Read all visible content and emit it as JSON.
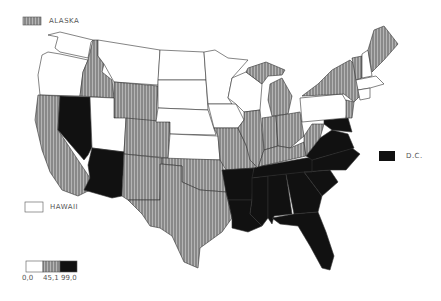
{
  "map": {
    "type": "choropleth",
    "region": "United States",
    "categories": [
      {
        "name": "low",
        "fill": "white",
        "color": "#ffffff"
      },
      {
        "name": "mid",
        "fill": "hatched",
        "color": "#8a8a8a"
      },
      {
        "name": "high",
        "fill": "black",
        "color": "#111111"
      }
    ],
    "insets": {
      "alaska": {
        "label": "ALASKA",
        "category": "mid"
      },
      "hawaii": {
        "label": "HAWAII",
        "category": "low"
      },
      "dc": {
        "label": "D.C.",
        "category": "high"
      }
    },
    "legend": {
      "values": [
        "0,0",
        "45,1",
        "99,0"
      ],
      "value_text": "0,0   45,1   99,0"
    },
    "states": {
      "low": [
        "WA",
        "OR",
        "MT",
        "ND",
        "SD",
        "NE",
        "MN",
        "WI",
        "IA",
        "UT",
        "PA",
        "NH",
        "KS",
        "WY-partial"
      ],
      "mid": [
        "CA",
        "ID",
        "WY",
        "CO",
        "NM",
        "TX",
        "OK",
        "MO",
        "IL",
        "IN",
        "MI",
        "OH",
        "NY",
        "ME",
        "VT",
        "MA",
        "CT",
        "NJ",
        "DE",
        "WV",
        "KY",
        "AZ-no"
      ],
      "high": [
        "NV",
        "AZ",
        "AR",
        "LA",
        "MS",
        "AL",
        "GA",
        "FL",
        "SC",
        "NC",
        "TN",
        "VA",
        "MD"
      ]
    }
  }
}
